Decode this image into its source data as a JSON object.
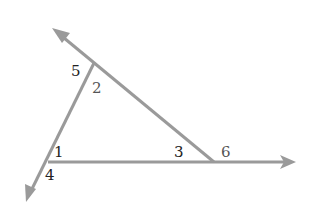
{
  "diagram": {
    "type": "geometry-triangle-exterior-angles",
    "line_color": "#9a9a9a",
    "label_color": "#222222",
    "vertices": {
      "top": {
        "x": 94,
        "y": 63
      },
      "left": {
        "x": 48,
        "y": 162
      },
      "right": {
        "x": 214,
        "y": 162
      }
    },
    "rays": [
      {
        "name": "ray-upper-left",
        "from": [
          214,
          162
        ],
        "to": [
          52,
          28
        ]
      },
      {
        "name": "ray-lower-left",
        "from": [
          94,
          63
        ],
        "to": [
          26,
          202
        ]
      },
      {
        "name": "ray-right",
        "from": [
          48,
          162
        ],
        "to": [
          296,
          162
        ]
      }
    ],
    "angle_labels": [
      {
        "id": "1",
        "text": "1",
        "x": 54,
        "y": 157
      },
      {
        "id": "2",
        "text": "2",
        "x": 92,
        "y": 93
      },
      {
        "id": "3",
        "text": "3",
        "x": 174,
        "y": 157
      },
      {
        "id": "4",
        "text": "4",
        "x": 45,
        "y": 180
      },
      {
        "id": "5",
        "text": "5",
        "x": 71,
        "y": 76
      },
      {
        "id": "6",
        "text": "6",
        "x": 221,
        "y": 157
      }
    ]
  }
}
